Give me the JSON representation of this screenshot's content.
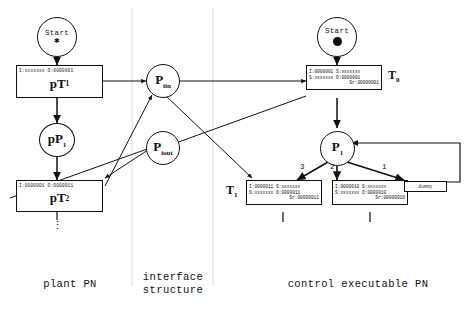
{
  "diagram": {
    "regions": [
      {
        "id": "plant",
        "label": "plant PN"
      },
      {
        "id": "interface",
        "label": "interface\nstructure",
        "line1": "interface",
        "line2": "structure"
      },
      {
        "id": "control",
        "label": "control executable PN"
      }
    ]
  },
  "plant": {
    "start": {
      "label": "Start",
      "token": "star"
    },
    "t1": {
      "header": "I:xxxxxxx O:0000001",
      "name": "pT",
      "sub": "1"
    },
    "place1": {
      "name": "pP",
      "sub": "1"
    },
    "t2": {
      "header": "I:0000001 O:0000011",
      "name": "pT",
      "sub": "2"
    },
    "ellipsis": "⋮"
  },
  "interface": {
    "p_iin": {
      "name": "P",
      "sub": "iin"
    },
    "p_iout": {
      "name": "P",
      "sub": "iout"
    }
  },
  "control": {
    "start": {
      "label": "Start",
      "token": "dot"
    },
    "t0": {
      "row1": "I:0000001 S:xxxxxxx",
      "row2": "S:xxxxxxx O:0000001",
      "row3": "Sr:00000001",
      "label": "T",
      "label_sub": "0"
    },
    "place1": {
      "name": "P",
      "sub": "1"
    },
    "t1": {
      "row1": "I:0000011 S:xxxxxxx",
      "row2": "S:xxxxxxx O:0000011",
      "row3": "Sr:00000011",
      "label": "T",
      "label_sub": "1"
    },
    "t2": {
      "row1": "I:0000010 S:xxxxxxx",
      "row2": "S:xxxxxxx O:0000010",
      "row3": "Sr:00000010"
    },
    "dummy": {
      "label": "dummy"
    },
    "arc_weights": {
      "left": "3",
      "middle": "2",
      "right": "1"
    }
  },
  "colors": {
    "stroke": "#111111",
    "divider": "#d8d8d8",
    "background": "#ffffff"
  }
}
